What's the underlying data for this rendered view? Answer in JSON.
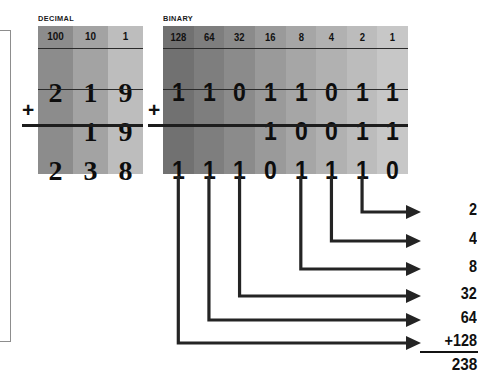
{
  "diagram": {
    "title_decimal": "DECIMAL",
    "title_binary": "BINARY",
    "plus_sign": "+"
  },
  "decimal_table": {
    "headers": [
      "100",
      "10",
      "1"
    ],
    "rows": [
      {
        "name": "addend-1",
        "digits": [
          "2",
          "1",
          "9"
        ]
      },
      {
        "name": "addend-2",
        "digits": [
          "",
          "1",
          "9"
        ]
      },
      {
        "name": "sum",
        "digits": [
          "2",
          "3",
          "8"
        ]
      }
    ],
    "column_shades": [
      "#8c8c8c",
      "#a3a3a3",
      "#bdbdbd"
    ]
  },
  "binary_table": {
    "headers": [
      "128",
      "64",
      "32",
      "16",
      "8",
      "4",
      "2",
      "1"
    ],
    "rows": [
      {
        "name": "addend-1",
        "bits": [
          "1",
          "1",
          "0",
          "1",
          "1",
          "0",
          "1",
          "1"
        ]
      },
      {
        "name": "addend-2",
        "bits": [
          "",
          "",
          "",
          "1",
          "0",
          "0",
          "1",
          "1"
        ]
      },
      {
        "name": "sum",
        "bits": [
          "1",
          "1",
          "1",
          "0",
          "1",
          "1",
          "1",
          "0"
        ]
      }
    ],
    "column_shades": [
      "#717171",
      "#7e7e7e",
      "#8b8b8b",
      "#9a9a9a",
      "#a6a6a6",
      "#b1b1b1",
      "#bcbcbc",
      "#c7c7c7"
    ]
  },
  "place_value_sum": {
    "entries": [
      "2",
      "4",
      "8",
      "32",
      "64",
      "+128"
    ],
    "total": "238"
  },
  "chart_data": {
    "type": "table",
    "decimal_operands": [
      219,
      19
    ],
    "decimal_result": 238,
    "binary_operands": [
      "11011011",
      "10011"
    ],
    "binary_result": "11101110",
    "place_values": [
      128,
      64,
      32,
      16,
      8,
      4,
      2,
      1
    ],
    "set_bits_in_result": [
      128,
      64,
      32,
      8,
      4,
      2
    ],
    "set_bit_sum": 238
  }
}
